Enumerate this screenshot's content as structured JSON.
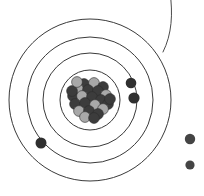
{
  "figure": {
    "width": 204,
    "height": 196,
    "background_color": "#ffffff"
  },
  "colors": {
    "shell_stroke": "#3a3a3a",
    "arc_stroke": "#4a4a4a",
    "electron_fill": "#2f2f2f",
    "free_particle_fill": "#444444",
    "proton_fill": "#3c3c3c",
    "neutron_fill": "#a8a8a8",
    "nucleon_outline": "#2b2b2b"
  },
  "nucleus": {
    "name": "nucleus",
    "center_x": 90,
    "center_y": 100,
    "radius": 21,
    "nucleon_radius": 5.4,
    "nucleons": [
      {
        "x": 84,
        "y": 84,
        "type": "proton"
      },
      {
        "x": 94,
        "y": 83,
        "type": "neutron"
      },
      {
        "x": 103,
        "y": 87,
        "type": "proton"
      },
      {
        "x": 78,
        "y": 89,
        "type": "neutron"
      },
      {
        "x": 88,
        "y": 90,
        "type": "proton"
      },
      {
        "x": 98,
        "y": 91,
        "type": "proton"
      },
      {
        "x": 106,
        "y": 95,
        "type": "neutron"
      },
      {
        "x": 73,
        "y": 96,
        "type": "proton"
      },
      {
        "x": 82,
        "y": 96,
        "type": "neutron"
      },
      {
        "x": 92,
        "y": 97,
        "type": "proton"
      },
      {
        "x": 101,
        "y": 100,
        "type": "proton"
      },
      {
        "x": 108,
        "y": 104,
        "type": "proton"
      },
      {
        "x": 75,
        "y": 104,
        "type": "proton"
      },
      {
        "x": 85,
        "y": 103,
        "type": "proton"
      },
      {
        "x": 95,
        "y": 105,
        "type": "neutron"
      },
      {
        "x": 103,
        "y": 109,
        "type": "neutron"
      },
      {
        "x": 79,
        "y": 111,
        "type": "neutron"
      },
      {
        "x": 89,
        "y": 111,
        "type": "proton"
      },
      {
        "x": 98,
        "y": 114,
        "type": "proton"
      },
      {
        "x": 85,
        "y": 117,
        "type": "neutron"
      },
      {
        "x": 94,
        "y": 118,
        "type": "proton"
      },
      {
        "x": 72,
        "y": 91,
        "type": "proton"
      },
      {
        "x": 110,
        "y": 99,
        "type": "proton"
      },
      {
        "x": 77,
        "y": 82,
        "type": "neutron"
      }
    ]
  },
  "shells": [
    {
      "name": "shell-1",
      "center_x": 90,
      "center_y": 100,
      "radius": 30
    },
    {
      "name": "shell-2",
      "center_x": 90,
      "center_y": 100,
      "radius": 47
    },
    {
      "name": "shell-3",
      "center_x": 90,
      "center_y": 100,
      "radius": 63
    },
    {
      "name": "shell-4",
      "center_x": 90,
      "center_y": 100,
      "radius": 81
    }
  ],
  "outer_arc": {
    "name": "partial-outer-shell-arc",
    "path": "M 170 -8 C 173 14 172 34 163 52",
    "note": "fragment of an outermost shell leaving the frame at the top right"
  },
  "electrons": [
    {
      "name": "electron-shell3-upper-right",
      "x": 131,
      "y": 83,
      "r": 5.3
    },
    {
      "name": "electron-shell2-right",
      "x": 134,
      "y": 98,
      "r": 5.6
    },
    {
      "name": "electron-shell3-lower-left",
      "x": 41,
      "y": 143,
      "r": 5.5
    }
  ],
  "free_particles": [
    {
      "name": "free-particle-upper",
      "x": 190,
      "y": 139,
      "r": 5.2
    },
    {
      "name": "free-particle-lower",
      "x": 190,
      "y": 165,
      "r": 4.6
    }
  ]
}
